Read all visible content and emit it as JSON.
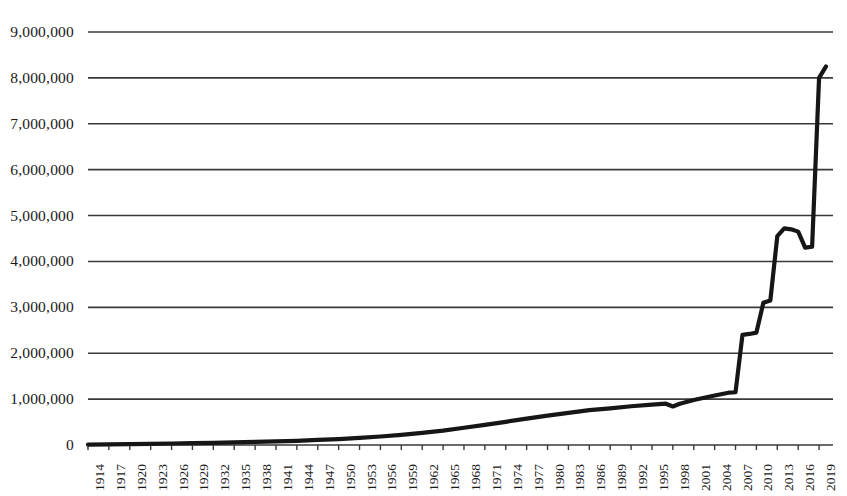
{
  "chart_data": {
    "type": "line",
    "title": "",
    "subtitle": "",
    "xlabel": "",
    "ylabel": "",
    "grid": true,
    "legend": false,
    "legend_position": "none",
    "xlim": [
      1914,
      2021
    ],
    "ylim": [
      0,
      9000000
    ],
    "y_ticks": [
      0,
      1000000,
      2000000,
      3000000,
      4000000,
      5000000,
      6000000,
      7000000,
      8000000,
      9000000
    ],
    "y_tick_labels": [
      "0",
      "1,000,000",
      "2,000,000",
      "3,000,000",
      "4,000,000",
      "5,000,000",
      "6,000,000",
      "7,000,000",
      "8,000,000",
      "9,000,000"
    ],
    "x_tick_labels": [
      "1914",
      "1917",
      "1920",
      "1923",
      "1926",
      "1929",
      "1932",
      "1935",
      "1938",
      "1941",
      "1944",
      "1947",
      "1950",
      "1953",
      "1956",
      "1959",
      "1962",
      "1965",
      "1968",
      "1971",
      "1974",
      "1977",
      "1980",
      "1983",
      "1986",
      "1989",
      "1992",
      "1995",
      "1998",
      "2001",
      "2004",
      "2007",
      "2010",
      "2013",
      "2016",
      "2019"
    ],
    "x_tick_step": 3,
    "line_color": "#161616",
    "grid_color": "#3a3a3a",
    "line_width": 4.2,
    "series": [
      {
        "name": "value",
        "x": [
          1914,
          1917,
          1920,
          1923,
          1926,
          1929,
          1932,
          1935,
          1938,
          1941,
          1944,
          1947,
          1950,
          1953,
          1956,
          1959,
          1962,
          1965,
          1968,
          1971,
          1974,
          1977,
          1980,
          1983,
          1986,
          1989,
          1992,
          1995,
          1997,
          1998,
          1999,
          2001,
          2004,
          2006,
          2007,
          2008,
          2009,
          2010,
          2011,
          2012,
          2013,
          2014,
          2015,
          2016,
          2017,
          2018,
          2019,
          2020
        ],
        "values": [
          10000,
          15000,
          20000,
          26000,
          33000,
          40000,
          48000,
          56000,
          66000,
          78000,
          92000,
          110000,
          130000,
          155000,
          185000,
          220000,
          265000,
          315000,
          375000,
          440000,
          505000,
          575000,
          640000,
          700000,
          760000,
          800000,
          845000,
          880000,
          900000,
          840000,
          900000,
          980000,
          1080000,
          1140000,
          1150000,
          2400000,
          2420000,
          2450000,
          3100000,
          3150000,
          4550000,
          4720000,
          4700000,
          4650000,
          4300000,
          4320000,
          8000000,
          8250000
        ]
      }
    ]
  }
}
